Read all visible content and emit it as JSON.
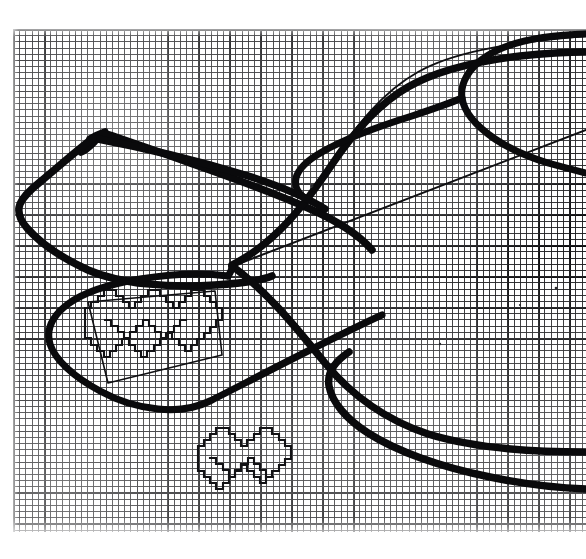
{
  "document": {
    "kind": "scanned-graph-paper-drawing",
    "subject": "mitten-glove-knitting-chart",
    "description": "Hand-drawn mitten / glove outline traced in heavy black marker over fine blue-grey graph paper, with pixel-stepped decorative motifs charted cell-by-cell inside the cuff band and below it.",
    "background_color": "#ffffff",
    "ink_color": "#0a0a0c",
    "grid_color": "#19191c",
    "grid_major_color": "#0a0a0c"
  },
  "canvas": {
    "width": 586,
    "height": 559
  },
  "paper": {
    "left": 13,
    "top": 29,
    "width": 573,
    "height": 503,
    "cell_size_px": 6.18,
    "major_every_cells": 5,
    "columns": 92,
    "rows": 81
  },
  "figures": {
    "mitten_body": {
      "label": "mitten-outline",
      "stroke_width": 7.5,
      "notes": "heavy marker outline of the glove body sweeping from the left cuff tip across to the right"
    },
    "thumb": {
      "label": "thumb-outline",
      "stroke_width": 7.0,
      "notes": "upper-right hooked thumb shape"
    },
    "cuff_band": {
      "label": "cuff-band-outline",
      "stroke_width": 7.0,
      "notes": "rounded rectangular cuff panel at lower left containing the charted motif"
    },
    "guide_line": {
      "label": "construction-guide-line",
      "stroke_width": 2.0,
      "notes": "thin ruled diagonal straight line running from lower-left to upper-right across the drawing"
    },
    "guide_curve": {
      "label": "construction-guide-curve",
      "stroke_width": 2.0,
      "notes": "thin parabolic curve opening to the right, marking the palm seam"
    },
    "motif_cuff": {
      "label": "stepped-motif-cuff",
      "stroke_width": 2.1,
      "notes": "pixel-stepped repeating heart / diamond chart motif drawn inside the cuff band"
    },
    "motif_lower": {
      "label": "stepped-motif-lower",
      "stroke_width": 2.1,
      "notes": "second pixel-stepped chart motif drawn free-standing below the cuff"
    }
  },
  "chart_data": {
    "type": "table",
    "grid": {
      "cell_px": 6.18,
      "columns": 92,
      "rows": 81,
      "major_every": 5,
      "grid_on": true
    },
    "motifs": [
      {
        "name": "cuff-band-motif",
        "repeats": 3,
        "shape": "stepped-heart-diamond",
        "region": "cuff band, lower left"
      },
      {
        "name": "lower-motif",
        "repeats": 2,
        "shape": "stepped-heart-diamond",
        "region": "below cuff, lower centre"
      }
    ],
    "xlabel": "",
    "ylabel": ""
  }
}
